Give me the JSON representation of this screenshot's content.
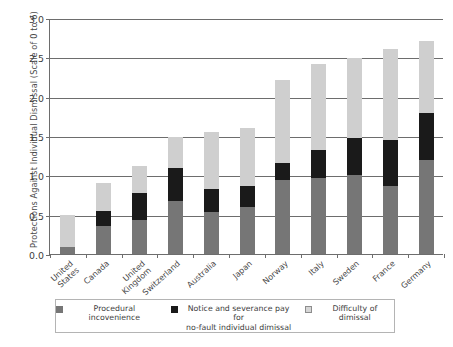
{
  "chart_data": {
    "type": "bar",
    "subtype": "stacked-vertical",
    "title": "",
    "xlabel": "",
    "ylabel": "Protections Against Individual Dismissal (Scale of 0 to 6)",
    "ylim": [
      0.0,
      3.0
    ],
    "ytick_labels": [
      "0.0",
      "0.5",
      "1.0",
      "1.5",
      "2.0",
      "2.5",
      "3.0"
    ],
    "ytick_values": [
      0.0,
      0.5,
      1.0,
      1.5,
      2.0,
      2.5,
      3.0
    ],
    "grid": true,
    "legend_position": "bottom",
    "categories": [
      "United States",
      "Canada",
      "United Kingdom",
      "Switzerland",
      "Australia",
      "Japan",
      "Norway",
      "Italy",
      "Sweden",
      "France",
      "Germany"
    ],
    "series": [
      {
        "name": "Procedural incovenience",
        "color": "#767676",
        "values": [
          0.09,
          0.35,
          0.43,
          0.67,
          0.53,
          0.6,
          0.94,
          0.96,
          1.0,
          0.86,
          1.19
        ]
      },
      {
        "name": "Notice and severance pay for\nno-fault individual dimissal",
        "color": "#1a1a1a",
        "values": [
          0.0,
          0.2,
          0.35,
          0.42,
          0.3,
          0.27,
          0.22,
          0.36,
          0.48,
          0.59,
          0.6
        ]
      },
      {
        "name": "Difficulty of dimissal",
        "color": "#cfcfcf",
        "values": [
          0.4,
          0.35,
          0.34,
          0.4,
          0.72,
          0.73,
          1.05,
          1.09,
          1.01,
          1.15,
          0.92
        ]
      }
    ],
    "totals": [
      0.49,
      0.9,
      1.12,
      1.49,
      1.55,
      1.6,
      2.21,
      2.41,
      2.49,
      2.6,
      2.71
    ]
  },
  "legend": {
    "items": [
      {
        "label": "Procedural incovenience",
        "swatch": "legend-swatch-procedural"
      },
      {
        "label": "Notice and severance pay for\nno-fault individual dimissal",
        "swatch": "legend-swatch-notice"
      },
      {
        "label": "Difficulty of dimissal",
        "swatch": "legend-swatch-difficulty"
      }
    ]
  },
  "footer": {
    "caption": ""
  },
  "colors": {
    "procedural": "#767676",
    "notice": "#1a1a1a",
    "difficulty": "#cfcfcf",
    "axis": "#6d6d6d",
    "text": "#3c3c3c"
  }
}
